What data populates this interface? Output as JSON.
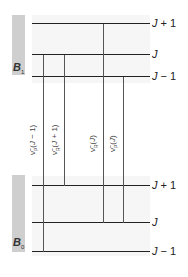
{
  "upper_state": {
    "label": "B",
    "subscript": "1",
    "levels": [
      {
        "label_j": "J",
        "label_suffix": " + 1"
      },
      {
        "label_j": "J",
        "label_suffix": ""
      },
      {
        "label_j": "J",
        "label_suffix": " − 1"
      }
    ]
  },
  "lower_state": {
    "label": "B",
    "subscript": "0",
    "levels": [
      {
        "label_j": "J",
        "label_suffix": " + 1"
      },
      {
        "label_j": "J",
        "label_suffix": ""
      },
      {
        "label_j": "J",
        "label_suffix": " − 1"
      }
    ]
  },
  "transitions": [
    {
      "prefix": "ν̃",
      "sub": "P",
      "arg_open": "(",
      "arg_j": "J",
      "arg_rest": " − 1)"
    },
    {
      "prefix": "ν̃",
      "sub": "R",
      "arg_open": "(",
      "arg_j": "J",
      "arg_rest": " + 1)"
    },
    {
      "prefix": "ν̃",
      "sub": "R",
      "arg_open": "(",
      "arg_j": "J",
      "arg_rest": ")"
    },
    {
      "prefix": "ν̃",
      "sub": "P",
      "arg_open": "(",
      "arg_j": "J",
      "arg_rest": ")"
    }
  ],
  "colors": {
    "sidebar": "#cfcfcf",
    "level_line": "#222222",
    "transition_line": "#555555"
  }
}
